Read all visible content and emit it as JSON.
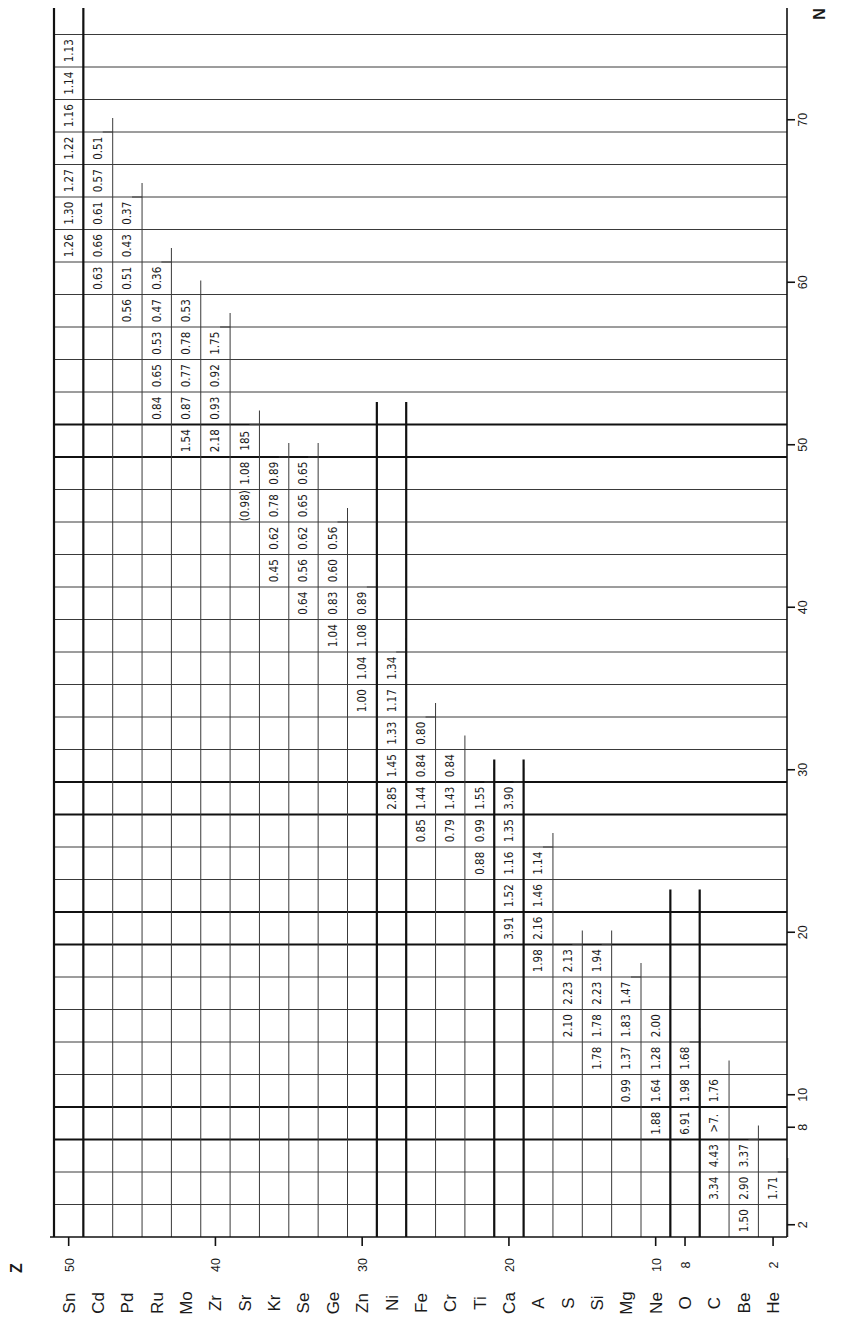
{
  "chart_data": {
    "type": "table",
    "title": "",
    "orientation_note": "figure rotated 90 degrees; Z runs right-to-left along bottom, N runs bottom-to-top along right side",
    "x_axis": {
      "label": "Z",
      "ticks": [
        50,
        40,
        30,
        20,
        10,
        8,
        2
      ]
    },
    "y_axis": {
      "label": "N",
      "ticks": [
        2,
        8,
        10,
        20,
        30,
        40,
        50,
        60,
        70
      ]
    },
    "magic_numbers": {
      "Z": [
        50,
        28,
        20,
        8
      ],
      "N": [
        50,
        28,
        20,
        8
      ]
    },
    "elements": [
      {
        "symbol": "Sn",
        "Z": 50,
        "cells": [
          {
            "N": 74,
            "v": "1.13"
          },
          {
            "N": 72,
            "v": "1.14"
          },
          {
            "N": 70,
            "v": "1.16"
          },
          {
            "N": 68,
            "v": "1.22"
          },
          {
            "N": 66,
            "v": "1.27"
          },
          {
            "N": 64,
            "v": "1.30"
          },
          {
            "N": 62,
            "v": "1.26"
          }
        ]
      },
      {
        "symbol": "Cd",
        "Z": 48,
        "cells": [
          {
            "N": 68,
            "v": "0.51"
          },
          {
            "N": 66,
            "v": "0.57"
          },
          {
            "N": 64,
            "v": "0.61"
          },
          {
            "N": 62,
            "v": "0.66"
          },
          {
            "N": 60,
            "v": "0.63"
          }
        ]
      },
      {
        "symbol": "Pd",
        "Z": 46,
        "cells": [
          {
            "N": 64,
            "v": "0.37"
          },
          {
            "N": 62,
            "v": "0.43"
          },
          {
            "N": 60,
            "v": "0.51"
          },
          {
            "N": 58,
            "v": "0.56"
          }
        ]
      },
      {
        "symbol": "Ru",
        "Z": 44,
        "cells": [
          {
            "N": 60,
            "v": "0.36"
          },
          {
            "N": 58,
            "v": "0.47"
          },
          {
            "N": 56,
            "v": "0.53"
          },
          {
            "N": 54,
            "v": "0.65"
          },
          {
            "N": 52,
            "v": "0.84"
          }
        ]
      },
      {
        "symbol": "Mo",
        "Z": 42,
        "cells": [
          {
            "N": 58,
            "v": "0.53"
          },
          {
            "N": 56,
            "v": "0.78"
          },
          {
            "N": 54,
            "v": "0.77"
          },
          {
            "N": 52,
            "v": "0.87"
          },
          {
            "N": 50,
            "v": "1.54"
          }
        ]
      },
      {
        "symbol": "Zr",
        "Z": 40,
        "cells": [
          {
            "N": 56,
            "v": "1.75"
          },
          {
            "N": 54,
            "v": "0.92"
          },
          {
            "N": 52,
            "v": "0.93"
          },
          {
            "N": 50,
            "v": "2.18"
          }
        ]
      },
      {
        "symbol": "Sr",
        "Z": 38,
        "cells": [
          {
            "N": 50,
            "v": "185"
          },
          {
            "N": 48,
            "v": "1.08"
          },
          {
            "N": 46,
            "v": "(0.98)"
          }
        ]
      },
      {
        "symbol": "Kr",
        "Z": 36,
        "cells": [
          {
            "N": 48,
            "v": "0.89"
          },
          {
            "N": 46,
            "v": "0.78"
          },
          {
            "N": 44,
            "v": "0.62"
          },
          {
            "N": 42,
            "v": "0.45"
          }
        ]
      },
      {
        "symbol": "Se",
        "Z": 34,
        "cells": [
          {
            "N": 48,
            "v": "0.65"
          },
          {
            "N": 46,
            "v": "0.65"
          },
          {
            "N": 44,
            "v": "0.62"
          },
          {
            "N": 42,
            "v": "0.56"
          },
          {
            "N": 40,
            "v": "0.64"
          }
        ]
      },
      {
        "symbol": "Ge",
        "Z": 32,
        "cells": [
          {
            "N": 44,
            "v": "0.56"
          },
          {
            "N": 42,
            "v": "0.60"
          },
          {
            "N": 40,
            "v": "0.83"
          },
          {
            "N": 38,
            "v": "1.04"
          }
        ]
      },
      {
        "symbol": "Zn",
        "Z": 30,
        "cells": [
          {
            "N": 40,
            "v": "0.89"
          },
          {
            "N": 38,
            "v": "1.08"
          },
          {
            "N": 36,
            "v": "1.04"
          },
          {
            "N": 34,
            "v": "1.00"
          }
        ]
      },
      {
        "symbol": "Ni",
        "Z": 28,
        "cells": [
          {
            "N": 36,
            "v": "1.34"
          },
          {
            "N": 34,
            "v": "1.17"
          },
          {
            "N": 32,
            "v": "1.33"
          },
          {
            "N": 30,
            "v": "1.45"
          },
          {
            "N": 28,
            "v": "2.85"
          }
        ]
      },
      {
        "symbol": "Fe",
        "Z": 26,
        "cells": [
          {
            "N": 32,
            "v": "0.80"
          },
          {
            "N": 30,
            "v": "0.84"
          },
          {
            "N": 28,
            "v": "1.44"
          },
          {
            "N": 26,
            "v": "0.85"
          }
        ]
      },
      {
        "symbol": "Cr",
        "Z": 24,
        "cells": [
          {
            "N": 30,
            "v": "0.84"
          },
          {
            "N": 28,
            "v": "1.43"
          },
          {
            "N": 26,
            "v": "0.79"
          }
        ]
      },
      {
        "symbol": "Ti",
        "Z": 22,
        "cells": [
          {
            "N": 28,
            "v": "1.55"
          },
          {
            "N": 26,
            "v": "0.99"
          },
          {
            "N": 24,
            "v": "0.88"
          }
        ]
      },
      {
        "symbol": "Ca",
        "Z": 20,
        "cells": [
          {
            "N": 28,
            "v": "3.90"
          },
          {
            "N": 26,
            "v": "1.35"
          },
          {
            "N": 24,
            "v": "1.16"
          },
          {
            "N": 22,
            "v": "1.52"
          },
          {
            "N": 20,
            "v": "3.91"
          }
        ]
      },
      {
        "symbol": "A",
        "Z": 18,
        "cells": [
          {
            "N": 24,
            "v": "1.14"
          },
          {
            "N": 22,
            "v": "1.46"
          },
          {
            "N": 20,
            "v": "2.16"
          },
          {
            "N": 18,
            "v": "1.98"
          }
        ]
      },
      {
        "symbol": "S",
        "Z": 16,
        "cells": [
          {
            "N": 18,
            "v": "2.13"
          },
          {
            "N": 16,
            "v": "2.23"
          },
          {
            "N": 14,
            "v": "2.10"
          }
        ]
      },
      {
        "symbol": "Si",
        "Z": 14,
        "cells": [
          {
            "N": 18,
            "v": "1.94"
          },
          {
            "N": 16,
            "v": "2.23"
          },
          {
            "N": 14,
            "v": "1.78"
          },
          {
            "N": 12,
            "v": "1.78"
          }
        ]
      },
      {
        "symbol": "Mg",
        "Z": 12,
        "cells": [
          {
            "N": 16,
            "v": "1.47"
          },
          {
            "N": 14,
            "v": "1.83"
          },
          {
            "N": 12,
            "v": "1.37"
          },
          {
            "N": 10,
            "v": "0.99"
          }
        ]
      },
      {
        "symbol": "Ne",
        "Z": 10,
        "cells": [
          {
            "N": 14,
            "v": "2.00"
          },
          {
            "N": 12,
            "v": "1.28"
          },
          {
            "N": 10,
            "v": "1.64"
          },
          {
            "N": 8,
            "v": "1.88"
          }
        ]
      },
      {
        "symbol": "O",
        "Z": 8,
        "cells": [
          {
            "N": 12,
            "v": "1.68"
          },
          {
            "N": 10,
            "v": "1.98"
          },
          {
            "N": 8,
            "v": "6.91"
          }
        ]
      },
      {
        "symbol": "C",
        "Z": 6,
        "cells": [
          {
            "N": 10,
            "v": "1.76"
          },
          {
            "N": 8,
            "v": ">7."
          },
          {
            "N": 6,
            "v": "4.43"
          },
          {
            "N": 4,
            "v": "3.34"
          }
        ]
      },
      {
        "symbol": "Be",
        "Z": 4,
        "cells": [
          {
            "N": 6,
            "v": "3.37"
          },
          {
            "N": 4,
            "v": "2.90"
          },
          {
            "N": 2,
            "v": "1.50"
          }
        ]
      },
      {
        "symbol": "He",
        "Z": 2,
        "cells": [
          {
            "N": 4,
            "v": "1.71"
          }
        ]
      }
    ],
    "grid": true,
    "legend": null
  },
  "colors": {
    "ink": "#1a1a1a",
    "paper": "#ffffff",
    "grid": "#3a3a3a"
  }
}
